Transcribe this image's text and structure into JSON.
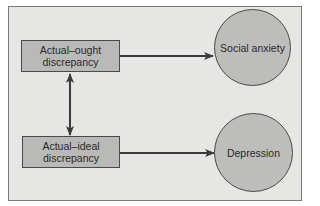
{
  "diagram": {
    "nodes": {
      "actual_ought": {
        "line1": "Actual–ought",
        "line2": "discrepancy"
      },
      "actual_ideal": {
        "line1": "Actual–ideal",
        "line2": "discrepancy"
      },
      "social_anxiety": {
        "label": "Social anxiety"
      },
      "depression": {
        "label": "Depression"
      }
    },
    "edges": [
      {
        "from": "actual_ought",
        "to": "social_anxiety",
        "type": "arrow"
      },
      {
        "from": "actual_ideal",
        "to": "depression",
        "type": "arrow"
      },
      {
        "from": "actual_ought",
        "to": "actual_ideal",
        "type": "bidirectional-arrow"
      }
    ],
    "colors": {
      "background": "#e6e6e4",
      "node_fill": "#b9b9b7",
      "stroke": "#4a4a4a"
    }
  }
}
